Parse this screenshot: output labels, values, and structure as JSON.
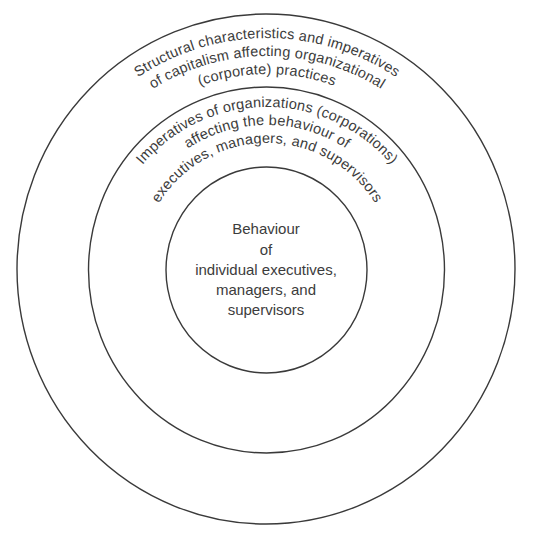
{
  "diagram": {
    "type": "concentric-circles",
    "colors": {
      "stroke": "#3a3a3a",
      "text": "#3c3c3c",
      "background": "#ffffff"
    },
    "outer_ring": {
      "lines": [
        "Structural characteristics and imperatives",
        "of capitalism affecting organizational",
        "(corporate) practices"
      ]
    },
    "middle_ring": {
      "lines": [
        "Imperatives of organizations (corporations)",
        "affecting the behaviour of",
        "executives, managers, and supervisors"
      ]
    },
    "inner_circle": {
      "lines": [
        "Behaviour",
        "of",
        "individual executives,",
        "managers, and",
        "supervisors"
      ]
    }
  }
}
